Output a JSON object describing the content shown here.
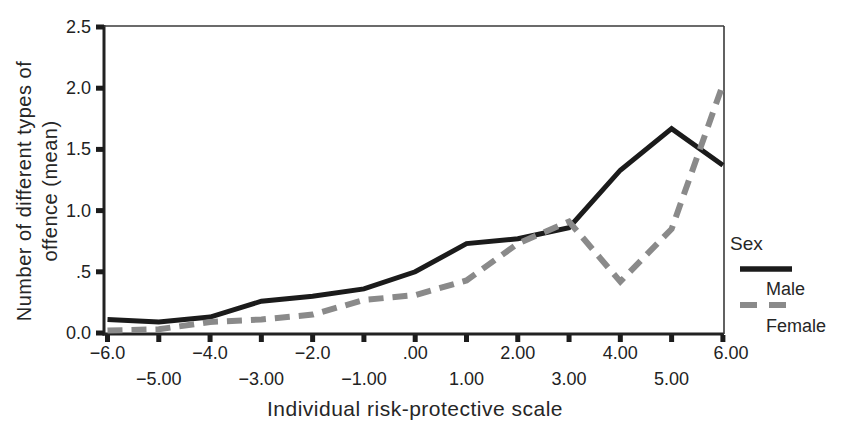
{
  "figure": {
    "background": "#ffffff",
    "text_color": "#262626",
    "y_axis_title_line1": "Number of different types of",
    "y_axis_title_line2": "offence (mean)",
    "x_axis_title": "Individual risk-protective scale",
    "legend": {
      "title": "Sex",
      "items": [
        {
          "label": "Male",
          "style": "solid",
          "color": "#1b1b1b"
        },
        {
          "label": "Female",
          "style": "dashed",
          "color": "#8a8a8a"
        }
      ]
    }
  },
  "chart_data": {
    "type": "line",
    "title": "",
    "xlabel": "Individual risk-protective scale",
    "ylabel": "Number of different types of offence (mean)",
    "xlim": [
      -6,
      6
    ],
    "ylim": [
      0,
      2.5
    ],
    "grid": false,
    "legend_position": "right-outside",
    "x": [
      -6,
      -5,
      -4,
      -3,
      -2,
      -1,
      0,
      1,
      2,
      3,
      4,
      5,
      6
    ],
    "series": [
      {
        "name": "Male",
        "style": "solid",
        "color": "#1b1b1b",
        "values": [
          0.11,
          0.09,
          0.13,
          0.26,
          0.3,
          0.36,
          0.5,
          0.73,
          0.77,
          0.86,
          1.33,
          1.67,
          1.37
        ]
      },
      {
        "name": "Female",
        "style": "dashed",
        "color": "#8a8a8a",
        "values": [
          0.02,
          0.03,
          0.09,
          0.11,
          0.15,
          0.27,
          0.31,
          0.43,
          0.73,
          0.91,
          0.42,
          0.85,
          2.03
        ]
      }
    ],
    "y_ticks": [
      {
        "v": 0.0,
        "label": "0.0"
      },
      {
        "v": 0.5,
        "label": ".5"
      },
      {
        "v": 1.0,
        "label": "1.0"
      },
      {
        "v": 1.5,
        "label": "1.5"
      },
      {
        "v": 2.0,
        "label": "2.0"
      },
      {
        "v": 2.5,
        "label": "2.5"
      }
    ],
    "x_ticks": [
      {
        "v": -6,
        "label": "−6.0",
        "row": 1
      },
      {
        "v": -5,
        "label": "−5.00",
        "row": 2
      },
      {
        "v": -4,
        "label": "−4.0",
        "row": 1
      },
      {
        "v": -3,
        "label": "−3.00",
        "row": 2
      },
      {
        "v": -2,
        "label": "−2.0",
        "row": 1
      },
      {
        "v": -1,
        "label": "−1.00",
        "row": 2
      },
      {
        "v": 0,
        "label": ".00",
        "row": 1
      },
      {
        "v": 1,
        "label": "1.00",
        "row": 2
      },
      {
        "v": 2,
        "label": "2.00",
        "row": 1
      },
      {
        "v": 3,
        "label": "3.00",
        "row": 2
      },
      {
        "v": 4,
        "label": "4.00",
        "row": 1
      },
      {
        "v": 5,
        "label": "5.00",
        "row": 2
      },
      {
        "v": 6,
        "label": "6.00",
        "row": 1
      }
    ]
  }
}
